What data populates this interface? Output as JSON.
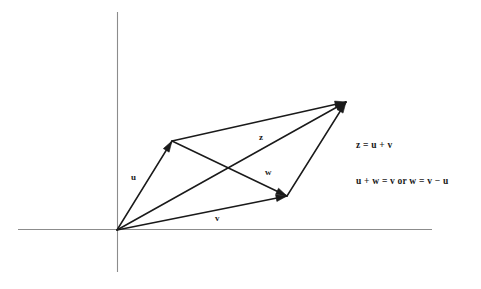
{
  "figure": {
    "background_color": "#ffffff",
    "stroke_color": "#1a1a1a",
    "axis_color": "#8c8c8c"
  },
  "axes": {
    "origin": {
      "x": 117,
      "y": 230
    },
    "x_axis": {
      "x1": 18,
      "y1": 229.5,
      "x2": 432,
      "y2": 229.5
    },
    "y_axis": {
      "x1": 117.5,
      "y1": 12,
      "x2": 117.5,
      "y2": 272
    }
  },
  "points": {
    "origin": {
      "x": 117,
      "y": 230
    },
    "u_tip": {
      "x": 172,
      "y": 141
    },
    "z_tip": {
      "x": 346,
      "y": 102
    },
    "v_tip": {
      "x": 287,
      "y": 196
    }
  },
  "vectors": [
    {
      "name": "u",
      "label": "u",
      "from": "origin",
      "to": "u_tip",
      "label_x": 131,
      "label_y": 180,
      "arrow": true
    },
    {
      "name": "v",
      "label": "v",
      "from": "origin",
      "to": "v_tip",
      "label_x": 215,
      "label_y": 221,
      "arrow": true
    },
    {
      "name": "z",
      "label": "z",
      "from": "origin",
      "to": "z_tip",
      "label_x": 259,
      "label_y": 140,
      "arrow": true
    },
    {
      "name": "w",
      "label": "w",
      "from": "u_tip",
      "to": "v_tip",
      "label_x": 265,
      "label_y": 175,
      "arrow": true
    }
  ],
  "edges": [
    {
      "name": "top-edge-u-to-z",
      "from": "u_tip",
      "to": "z_tip",
      "arrow": true
    },
    {
      "name": "right-edge-v-to-z",
      "from": "v_tip",
      "to": "z_tip",
      "arrow": true
    }
  ],
  "equations": {
    "first": "z = u + v",
    "second": "u + w = v or w = v − u"
  },
  "chart_data": {
    "type": "diagram",
    "subtype": "vector-parallelogram",
    "coordinate_system": {
      "origin_px": [
        117,
        230
      ],
      "y_axis_up": true
    },
    "vertices": {
      "O": [
        0,
        0
      ],
      "U": [
        55,
        89
      ],
      "Z": [
        229,
        128
      ],
      "V": [
        170,
        34
      ]
    },
    "vectors": [
      {
        "name": "u",
        "tail": "O",
        "head": "U",
        "components": [
          55,
          89
        ]
      },
      {
        "name": "v",
        "tail": "O",
        "head": "V",
        "components": [
          170,
          34
        ]
      },
      {
        "name": "z",
        "tail": "O",
        "head": "Z",
        "components": [
          229,
          128
        ]
      },
      {
        "name": "w",
        "tail": "U",
        "head": "V",
        "components": [
          115,
          -55
        ]
      }
    ],
    "relations": [
      "z = u + v",
      "u + w = v",
      "w = v − u"
    ],
    "labels": [
      "u",
      "v",
      "z",
      "w"
    ],
    "grid": false,
    "legend": "none"
  }
}
